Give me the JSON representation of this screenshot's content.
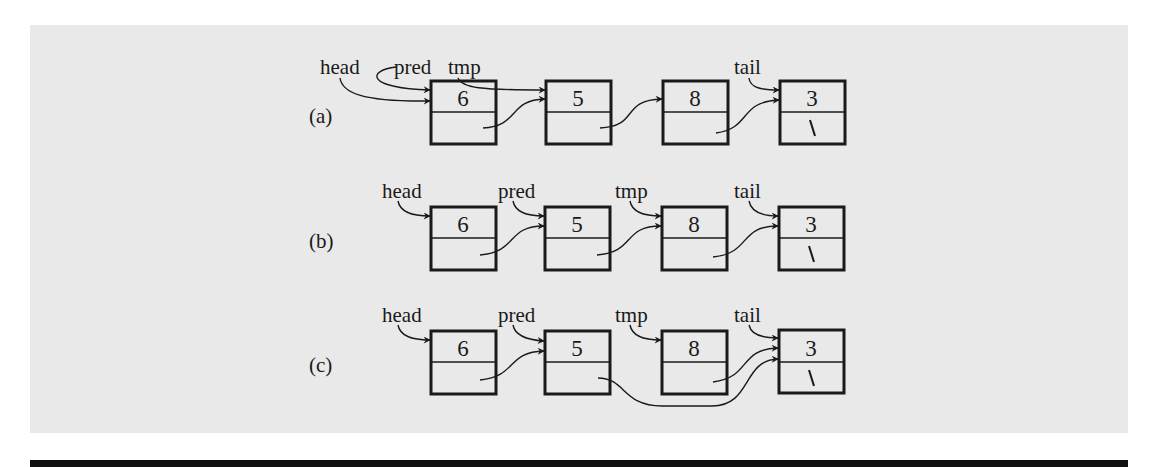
{
  "colors": {
    "panel": "#e9e9e9",
    "ink": "#1a1a1a",
    "rule": "#111111"
  },
  "node_values": [
    "6",
    "5",
    "8",
    "3"
  ],
  "null_glyph": "\\",
  "rows": [
    {
      "tag": "(a)",
      "pointers": {
        "head": "head",
        "pred": "pred",
        "tmp": "tmp",
        "tail": "tail"
      },
      "description": "head and pred both point to node 6; tmp points to node 5; tail points to node 3"
    },
    {
      "tag": "(b)",
      "pointers": {
        "head": "head",
        "pred": "pred",
        "tmp": "tmp",
        "tail": "tail"
      },
      "description": "head points to node 6; pred points to node 5; tmp points to node 8; tail points to node 3"
    },
    {
      "tag": "(c)",
      "pointers": {
        "head": "head",
        "pred": "pred",
        "tmp": "tmp",
        "tail": "tail"
      },
      "description": "node 5's next bypasses node 8 and points directly to node 3"
    }
  ]
}
